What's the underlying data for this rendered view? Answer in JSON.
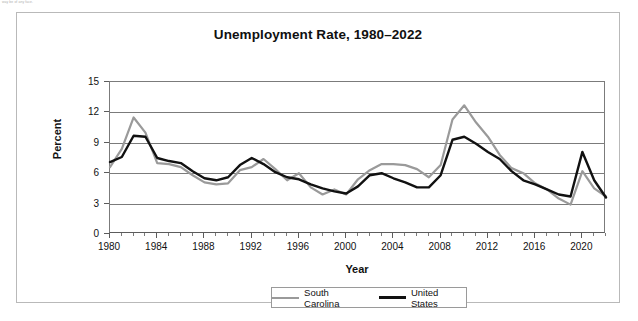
{
  "figure": {
    "faint_note": "way be of any face.",
    "title": "Unemployment Rate, 1980–2022"
  },
  "chart_data": {
    "type": "line",
    "title": "Unemployment Rate, 1980–2022",
    "xlabel": "Year",
    "ylabel": "Percent",
    "xlim": [
      1980,
      2022
    ],
    "ylim": [
      0,
      15
    ],
    "ytick_values": [
      0,
      3,
      6,
      9,
      12,
      15
    ],
    "ytick_labels": [
      "0",
      "3",
      "6",
      "9",
      "12",
      "15"
    ],
    "xtick_values": [
      1980,
      1984,
      1988,
      1992,
      1996,
      2000,
      2004,
      2008,
      2012,
      2016,
      2020
    ],
    "xtick_labels": [
      "1980",
      "1984",
      "1988",
      "1992",
      "1996",
      "2000",
      "2004",
      "2008",
      "2012",
      "2016",
      "2020"
    ],
    "xtick_minor_step": 1,
    "grid": "horizontal",
    "legend_position": "bottom-center",
    "x": [
      1980,
      1981,
      1982,
      1983,
      1984,
      1985,
      1986,
      1987,
      1988,
      1989,
      1990,
      1991,
      1992,
      1993,
      1994,
      1995,
      1996,
      1997,
      1998,
      1999,
      2000,
      2001,
      2002,
      2003,
      2004,
      2005,
      2006,
      2007,
      2008,
      2009,
      2010,
      2011,
      2012,
      2013,
      2014,
      2015,
      2016,
      2017,
      2018,
      2019,
      2020,
      2021,
      2022
    ],
    "series": [
      {
        "name": "South Carolina",
        "color": "#9a9a9a",
        "values": [
          6.6,
          8.4,
          11.5,
          10.0,
          7.0,
          6.9,
          6.6,
          5.8,
          5.1,
          4.9,
          5.0,
          6.3,
          6.6,
          7.4,
          6.4,
          5.3,
          6.0,
          4.6,
          3.9,
          4.4,
          3.9,
          5.4,
          6.3,
          6.9,
          6.9,
          6.8,
          6.4,
          5.6,
          6.8,
          11.3,
          12.7,
          11.0,
          9.6,
          7.8,
          6.5,
          6.0,
          5.0,
          4.4,
          3.5,
          2.9,
          6.2,
          4.5,
          3.7
        ]
      },
      {
        "name": "United States",
        "color": "#111111",
        "values": [
          7.1,
          7.6,
          9.7,
          9.6,
          7.5,
          7.2,
          7.0,
          6.2,
          5.5,
          5.3,
          5.6,
          6.8,
          7.5,
          6.9,
          6.1,
          5.6,
          5.4,
          4.9,
          4.5,
          4.2,
          4.0,
          4.7,
          5.8,
          6.0,
          5.5,
          5.1,
          4.6,
          4.6,
          5.8,
          9.3,
          9.6,
          8.9,
          8.1,
          7.4,
          6.2,
          5.3,
          4.9,
          4.4,
          3.9,
          3.7,
          8.1,
          5.3,
          3.6
        ]
      }
    ]
  },
  "legend": {
    "entries": [
      {
        "label": "South Carolina",
        "color": "#9a9a9a"
      },
      {
        "label": "United States",
        "color": "#111111"
      }
    ]
  }
}
